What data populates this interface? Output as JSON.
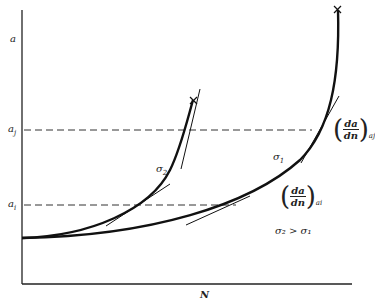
{
  "axes": {
    "y_label": "a",
    "x_label": "N",
    "y_ticks": [
      {
        "label": "a",
        "sub": "j",
        "y": 130
      },
      {
        "label": "a",
        "sub": "i",
        "y": 205
      }
    ]
  },
  "curves": [
    {
      "name": "sigma2",
      "label": "σ",
      "sub": "2",
      "end_marker": "×"
    },
    {
      "name": "sigma1",
      "label": "σ",
      "sub": "1",
      "end_marker": "×"
    }
  ],
  "annotations": {
    "slope_j": {
      "num": "da",
      "den": "dn",
      "sub": "a",
      "subsub": "j"
    },
    "slope_i": {
      "num": "da",
      "den": "dn",
      "sub": "a",
      "subsub": "i"
    },
    "relation": "σ₂ > σ₁"
  },
  "colors": {
    "line": "#111111",
    "dash": "#333333"
  }
}
